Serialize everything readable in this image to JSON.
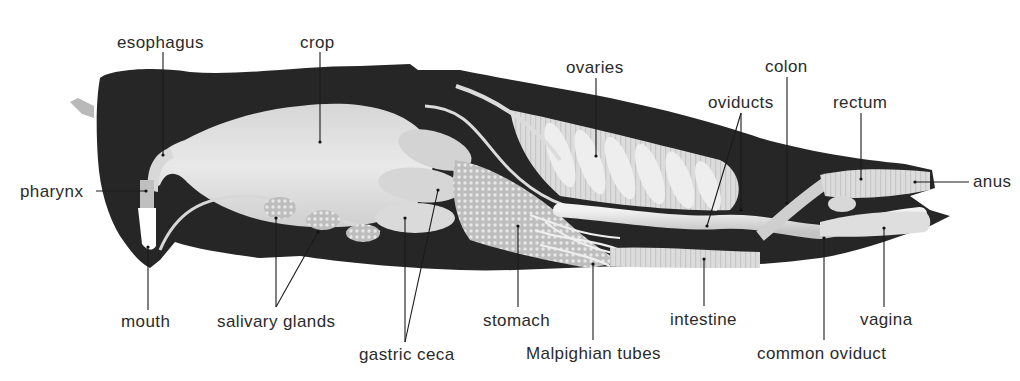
{
  "figure": {
    "colors": {
      "background": "#ffffff",
      "body_cavity": "#262626",
      "organ_light": "#e6e6e6",
      "organ_mid": "#c9c9c9",
      "label_text": "#2b2b2b",
      "leader_line": "#1a1a1a"
    }
  },
  "labels": [
    {
      "id": "esophagus",
      "text": "esophagus",
      "x": 117,
      "y": 48,
      "anchor": "start"
    },
    {
      "id": "crop",
      "text": "crop",
      "x": 300,
      "y": 48,
      "anchor": "start"
    },
    {
      "id": "ovaries",
      "text": "ovaries",
      "x": 566,
      "y": 73,
      "anchor": "start"
    },
    {
      "id": "colon",
      "text": "colon",
      "x": 765,
      "y": 72,
      "anchor": "start"
    },
    {
      "id": "oviducts",
      "text": "oviducts",
      "x": 708,
      "y": 108,
      "anchor": "start"
    },
    {
      "id": "rectum",
      "text": "rectum",
      "x": 833,
      "y": 108,
      "anchor": "start"
    },
    {
      "id": "pharynx",
      "text": "pharynx",
      "x": 20,
      "y": 197,
      "anchor": "start"
    },
    {
      "id": "anus",
      "text": "anus",
      "x": 973,
      "y": 187,
      "anchor": "start"
    },
    {
      "id": "mouth",
      "text": "mouth",
      "x": 121,
      "y": 327,
      "anchor": "start"
    },
    {
      "id": "salivary_glands",
      "text": "salivary glands",
      "x": 217,
      "y": 327,
      "anchor": "start"
    },
    {
      "id": "stomach",
      "text": "stomach",
      "x": 483,
      "y": 326,
      "anchor": "start"
    },
    {
      "id": "intestine",
      "text": "intestine",
      "x": 670,
      "y": 325,
      "anchor": "start"
    },
    {
      "id": "vagina",
      "text": "vagina",
      "x": 860,
      "y": 325,
      "anchor": "start"
    },
    {
      "id": "gastric_ceca",
      "text": "gastric ceca",
      "x": 359,
      "y": 360,
      "anchor": "start"
    },
    {
      "id": "malpighian_tubes",
      "text": "Malpighian tubes",
      "x": 526,
      "y": 359,
      "anchor": "start"
    },
    {
      "id": "common_oviduct",
      "text": "common oviduct",
      "x": 757,
      "y": 359,
      "anchor": "start"
    }
  ]
}
